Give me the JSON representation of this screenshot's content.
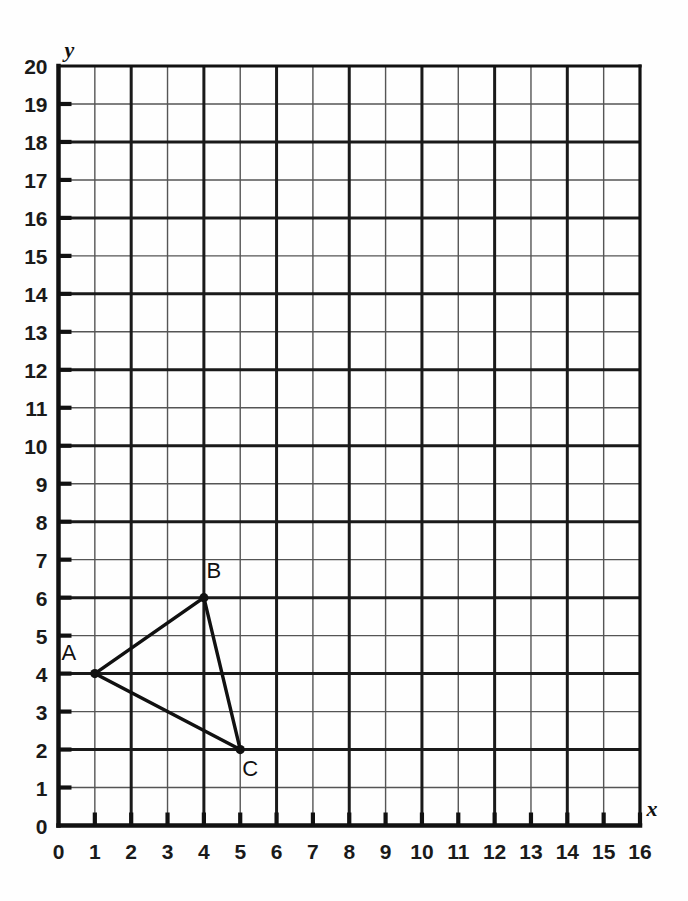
{
  "chart_data": {
    "type": "scatter",
    "title": "",
    "xlabel": "x",
    "ylabel": "y",
    "xlim": [
      0,
      16
    ],
    "ylim": [
      0,
      20
    ],
    "grid": true,
    "legend": false,
    "x_ticks": [
      "0",
      "1",
      "2",
      "3",
      "4",
      "5",
      "6",
      "7",
      "8",
      "9",
      "10",
      "11",
      "12",
      "13",
      "14",
      "15",
      "16"
    ],
    "y_ticks": [
      "0",
      "1",
      "2",
      "3",
      "4",
      "5",
      "6",
      "7",
      "8",
      "9",
      "10",
      "11",
      "12",
      "13",
      "14",
      "15",
      "16",
      "17",
      "18",
      "19",
      "20"
    ],
    "x_tick_values": [
      0,
      1,
      2,
      3,
      4,
      5,
      6,
      7,
      8,
      9,
      10,
      11,
      12,
      13,
      14,
      15,
      16
    ],
    "y_tick_values": [
      0,
      1,
      2,
      3,
      4,
      5,
      6,
      7,
      8,
      9,
      10,
      11,
      12,
      13,
      14,
      15,
      16,
      17,
      18,
      19,
      20
    ],
    "annotations": [
      {
        "label": "A",
        "x": 1,
        "y": 4,
        "label_dx": -26,
        "label_dy": -14
      },
      {
        "label": "B",
        "x": 4,
        "y": 6,
        "label_dx": 10,
        "label_dy": -20
      },
      {
        "label": "C",
        "x": 5,
        "y": 2,
        "label_dx": 10,
        "label_dy": 26
      }
    ],
    "series": [
      {
        "name": "triangle-ABC",
        "type": "polygon",
        "closed": true,
        "points": [
          {
            "label": "A",
            "x": 1,
            "y": 4
          },
          {
            "label": "B",
            "x": 4,
            "y": 6
          },
          {
            "label": "C",
            "x": 5,
            "y": 2
          }
        ]
      }
    ],
    "colors": {
      "background": "#fefefe",
      "grid_minor": "#555555",
      "grid_major": "#1a1a1a",
      "axis": "#111111",
      "shape_stroke": "#111111",
      "point_fill": "#111111",
      "text": "#1a1a1a"
    }
  },
  "axis_labels": {
    "x": "x",
    "y": "y"
  }
}
